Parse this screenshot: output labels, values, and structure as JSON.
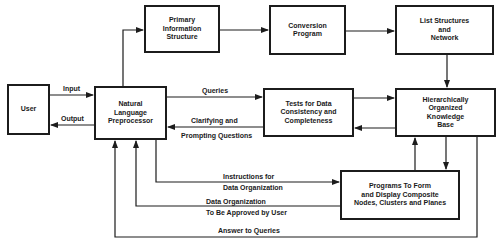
{
  "diagram": {
    "nodes": {
      "user": {
        "label": "User"
      },
      "nlp": {
        "lines": [
          "Natural",
          "Language",
          "Preprocessor"
        ]
      },
      "primary": {
        "lines": [
          "Primary",
          "Information",
          "Structure"
        ]
      },
      "conversion": {
        "lines": [
          "Conversion",
          "Program"
        ]
      },
      "list": {
        "lines": [
          "List Structures",
          "and",
          "Network"
        ]
      },
      "tests": {
        "lines": [
          "Tests for Data",
          "Consistency and",
          "Completeness"
        ]
      },
      "hokb": {
        "lines": [
          "Hierarchically",
          "Organized",
          "Knowledge",
          "Base"
        ]
      },
      "programs": {
        "lines": [
          "Programs To Form",
          "and Display Composite",
          "Nodes, Clusters and Planes"
        ]
      }
    },
    "edges": {
      "input": "Input",
      "output": "Output",
      "queries": "Queries",
      "clarifying_1": "Clarifying and",
      "clarifying_2": "Prompting Questions",
      "instructions_1": "Instructions for",
      "instructions_2": "Data Organization",
      "approval_1": "Data Organization",
      "approval_2": "To Be Approved by User",
      "answer": "Answer to Queries"
    },
    "line_color": "#1c1c1c"
  }
}
